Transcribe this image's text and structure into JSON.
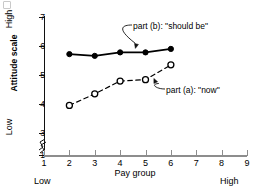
{
  "chart_data": {
    "type": "line",
    "title": "",
    "subtitle": "",
    "xlabel": "Pay group",
    "ylabel": "Attitude scale",
    "x": [
      2,
      3,
      4,
      5,
      6
    ],
    "xlim": [
      1,
      9
    ],
    "ylim": [
      1,
      7
    ],
    "xticks": [
      "1",
      "2",
      "3",
      "4",
      "5",
      "6",
      "7",
      "8",
      "9"
    ],
    "yticks": [
      "1",
      "3",
      "4",
      "5",
      "6",
      "7"
    ],
    "y_axis_break": true,
    "y_axis_break_between": [
      1,
      3
    ],
    "grid": false,
    "legend": "none",
    "x_end_labels": {
      "left": "Low",
      "right": "High"
    },
    "y_end_labels": {
      "bottom": "Low",
      "top": "High"
    },
    "series": [
      {
        "name": "part (b): \"should be\"",
        "marker": "filled-circle",
        "linestyle": "solid",
        "color": "#000000",
        "values": [
          5.72,
          5.66,
          5.78,
          5.78,
          5.9
        ]
      },
      {
        "name": "part (a): \"now\"",
        "marker": "open-circle",
        "linestyle": "dashed",
        "color": "#000000",
        "values": [
          3.95,
          4.35,
          4.79,
          4.84,
          5.35
        ]
      }
    ],
    "annotations": [
      {
        "id": "annot-b",
        "text": "part (b): \"should be\"",
        "points_to_series": "part (b): \"should be\"",
        "points_to_x": 4.6
      },
      {
        "id": "annot-a",
        "text": "part (a): \"now\"",
        "points_to_series": "part (a): \"now\"",
        "points_to_x": 5.3
      }
    ]
  }
}
